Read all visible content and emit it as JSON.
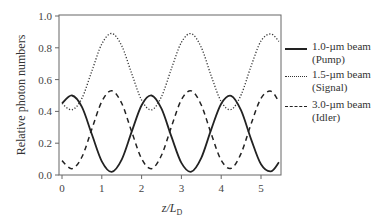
{
  "chart_data": {
    "type": "line",
    "title": "",
    "xlabel": "z/L_D",
    "ylabel": "Relative photon numbers",
    "xlim": [
      0,
      5.5
    ],
    "ylim": [
      0,
      1.0
    ],
    "xticks": [
      "0",
      "1",
      "2",
      "3",
      "4",
      "5"
    ],
    "yticks": [
      "0.0",
      "0.2",
      "0.4",
      "0.6",
      "0.8",
      "1.0"
    ],
    "grid": false,
    "legend_position": "right",
    "x": [
      0,
      0.25,
      0.5,
      0.75,
      1.0,
      1.25,
      1.5,
      1.75,
      2.0,
      2.25,
      2.5,
      2.75,
      3.0,
      3.25,
      3.5,
      3.75,
      4.0,
      4.25,
      4.5,
      4.75,
      5.0,
      5.25,
      5.45
    ],
    "series": [
      {
        "name": "1.0-µm beam (Pump)",
        "style": "solid",
        "values": [
          0.45,
          0.5,
          0.428,
          0.256,
          0.086,
          0.02,
          0.097,
          0.271,
          0.439,
          0.5,
          0.417,
          0.241,
          0.076,
          0.021,
          0.108,
          0.287,
          0.448,
          0.498,
          0.406,
          0.226,
          0.067,
          0.023,
          0.08
        ]
      },
      {
        "name": "1.5-µm beam (Signal)",
        "style": "dotted",
        "values": [
          0.45,
          0.41,
          0.482,
          0.654,
          0.824,
          0.89,
          0.813,
          0.639,
          0.471,
          0.41,
          0.493,
          0.669,
          0.834,
          0.889,
          0.802,
          0.623,
          0.462,
          0.412,
          0.504,
          0.684,
          0.843,
          0.887,
          0.84
        ]
      },
      {
        "name": "3.0-µm beam (Idler)",
        "style": "dashed",
        "values": [
          0.09,
          0.04,
          0.113,
          0.289,
          0.462,
          0.53,
          0.451,
          0.273,
          0.102,
          0.04,
          0.124,
          0.304,
          0.473,
          0.529,
          0.44,
          0.258,
          0.093,
          0.042,
          0.136,
          0.32,
          0.482,
          0.527,
          0.46
        ]
      }
    ]
  },
  "legend": [
    {
      "line1": "1.0-µm beam",
      "line2": "(Pump)"
    },
    {
      "line1": "1.5-µm beam",
      "line2": "(Signal)"
    },
    {
      "line1": "3.0-µm beam",
      "line2": "(Idler)"
    }
  ],
  "axis": {
    "ylabel": "Relative photon numbers",
    "xlabel_main": "z/L",
    "xlabel_sub": "D"
  }
}
